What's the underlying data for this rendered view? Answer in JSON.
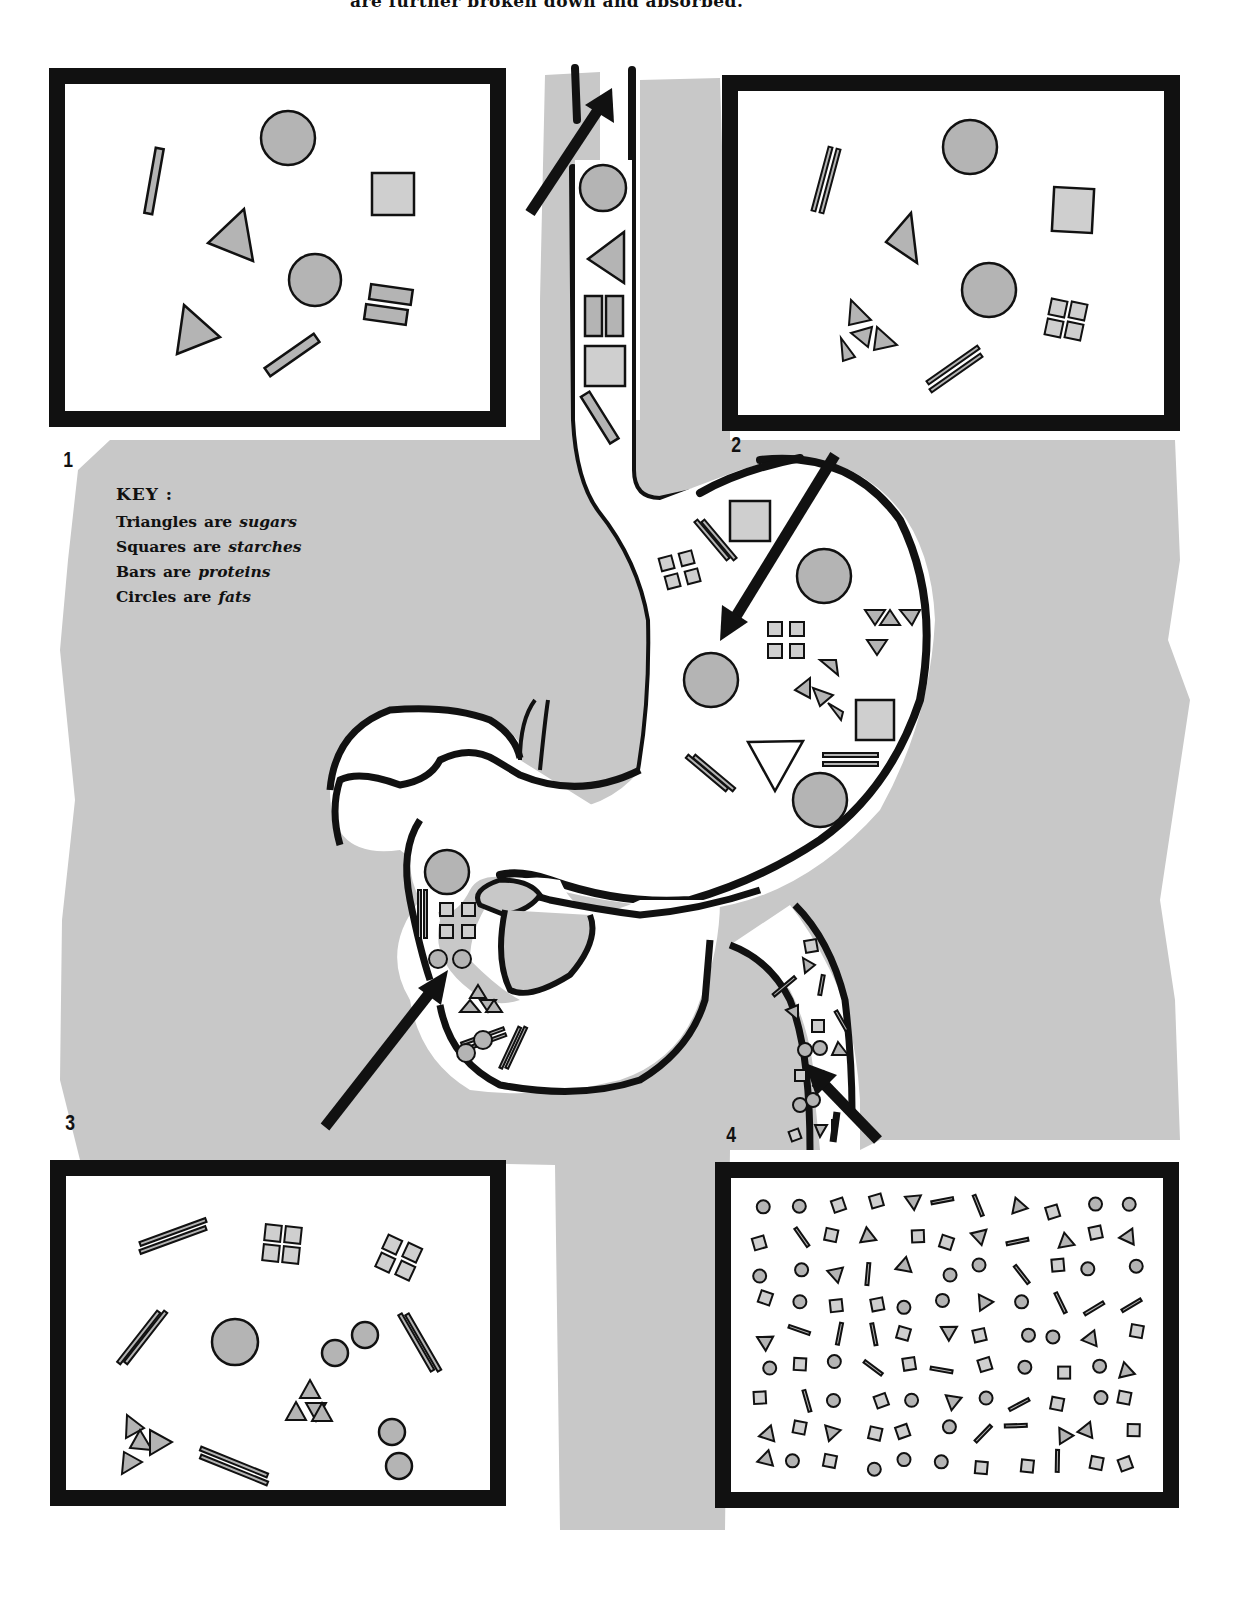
{
  "caption": {
    "top_text": "are further broken down and absorbed."
  },
  "steps": [
    {
      "number": "1",
      "panel": "top-left",
      "description": "Whole food particles: large shapes"
    },
    {
      "number": "2",
      "panel": "top-right",
      "description": "Partially broken down in stomach"
    },
    {
      "number": "3",
      "panel": "bottom-left",
      "description": "Further broken down in duodenum"
    },
    {
      "number": "4",
      "panel": "bottom-right",
      "description": "Small molecules absorbed in intestine"
    }
  ],
  "key": {
    "title": "KEY :",
    "items": [
      {
        "shape": "Triangles",
        "verb": "are",
        "nutrient": "sugars",
        "icon": "triangle-icon"
      },
      {
        "shape": "Squares",
        "verb": "are",
        "nutrient": "starches",
        "icon": "square-icon"
      },
      {
        "shape": "Bars",
        "verb": "are",
        "nutrient": "proteins",
        "icon": "bar-icon"
      },
      {
        "shape": "Circles",
        "verb": "are",
        "nutrient": "fats",
        "icon": "circle-icon"
      }
    ]
  },
  "colors": {
    "background": "#ffffff",
    "gray_backdrop": "#c8c8c8",
    "shape_fill": "#b4b4b4",
    "square_fill": "#cfcfcf",
    "outline": "#111111"
  }
}
